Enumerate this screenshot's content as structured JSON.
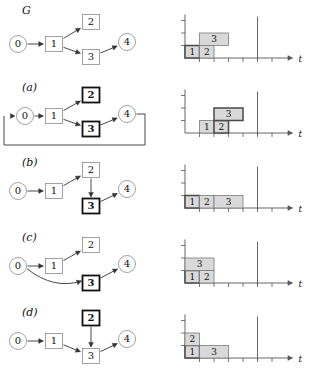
{
  "figure": {
    "title": "",
    "row_labels": [
      "G",
      "(a)",
      "(b)",
      "(c)",
      "(d)"
    ],
    "axis_label": "t",
    "node_ids": [
      "0",
      "1",
      "2",
      "3",
      "4"
    ],
    "colors": {
      "bar_fill": "#d9d9d9",
      "bar_stroke": "#7a7a7a",
      "bar_stroke_bold": "#4a4a4a",
      "node_stroke": "#8a8a8a",
      "node_stroke_bold": "#111111",
      "edge": "#333333",
      "axis": "#555555",
      "text": "#111111"
    }
  },
  "rows": [
    {
      "id": "G",
      "label": "G",
      "graph": {
        "nodes": [
          {
            "id": "0",
            "label": "0",
            "shape": "circle",
            "bold": false,
            "x": 18,
            "y": 44
          },
          {
            "id": "1",
            "label": "1",
            "shape": "box",
            "bold": false,
            "x": 54,
            "y": 44
          },
          {
            "id": "2",
            "label": "2",
            "shape": "box",
            "bold": false,
            "x": 91,
            "y": 22
          },
          {
            "id": "3",
            "label": "3",
            "shape": "box",
            "bold": false,
            "x": 91,
            "y": 57
          },
          {
            "id": "4",
            "label": "4",
            "shape": "circle",
            "bold": false,
            "x": 127,
            "y": 42
          }
        ],
        "edges": [
          {
            "from": "0",
            "to": "1",
            "style": "straight"
          },
          {
            "from": "1",
            "to": "2",
            "style": "straight"
          },
          {
            "from": "1",
            "to": "3",
            "style": "straight"
          },
          {
            "from": "3",
            "to": "4",
            "style": "straight"
          }
        ]
      },
      "chart_data": {
        "type": "bar",
        "orientation": "gantt",
        "title": "",
        "xlabel": "t",
        "ylabel": "",
        "xlim": [
          0,
          7
        ],
        "ylim": [
          0,
          3
        ],
        "grid": false,
        "xticks": [
          0,
          1,
          2,
          3,
          4,
          5,
          6
        ],
        "ticklabels": [],
        "deadline": 5,
        "tasks": [
          {
            "label": "1",
            "start": 0,
            "duration": 1,
            "lane": 0,
            "bold": true
          },
          {
            "label": "2",
            "start": 1,
            "duration": 1,
            "lane": 0,
            "bold": false
          },
          {
            "label": "3",
            "start": 1,
            "duration": 2,
            "lane": 1,
            "bold": false
          }
        ]
      }
    },
    {
      "id": "a",
      "label": "(a)",
      "graph": {
        "nodes": [
          {
            "id": "0",
            "label": "0",
            "shape": "circle",
            "bold": false,
            "x": 25,
            "y": 41
          },
          {
            "id": "1",
            "label": "1",
            "shape": "box",
            "bold": false,
            "x": 54,
            "y": 41
          },
          {
            "id": "2",
            "label": "2",
            "shape": "box",
            "bold": true,
            "x": 91,
            "y": 20
          },
          {
            "id": "3",
            "label": "3",
            "shape": "box",
            "bold": true,
            "x": 91,
            "y": 54
          },
          {
            "id": "4",
            "label": "4",
            "shape": "circle",
            "bold": false,
            "x": 127,
            "y": 39
          }
        ],
        "edges": [
          {
            "from": "0",
            "to": "1",
            "style": "straight"
          },
          {
            "from": "1",
            "to": "2",
            "style": "straight"
          },
          {
            "from": "1",
            "to": "3",
            "style": "straight"
          },
          {
            "from": "3",
            "to": "4",
            "style": "straight"
          },
          {
            "from": "4",
            "to": "0",
            "style": "feedback"
          }
        ]
      },
      "chart_data": {
        "type": "bar",
        "orientation": "gantt",
        "title": "",
        "xlabel": "t",
        "ylabel": "",
        "xlim": [
          0,
          7
        ],
        "ylim": [
          0,
          3
        ],
        "grid": false,
        "xticks": [
          0,
          1,
          2,
          3,
          4,
          5,
          6
        ],
        "ticklabels": [],
        "deadline": 5,
        "tasks": [
          {
            "label": "1",
            "start": 1,
            "duration": 1,
            "lane": 0,
            "bold": false
          },
          {
            "label": "2",
            "start": 2,
            "duration": 1,
            "lane": 0,
            "bold": true
          },
          {
            "label": "3",
            "start": 2,
            "duration": 2,
            "lane": 1,
            "bold": true
          }
        ]
      }
    },
    {
      "id": "b",
      "label": "(b)",
      "graph": {
        "nodes": [
          {
            "id": "0",
            "label": "0",
            "shape": "circle",
            "bold": false,
            "x": 18,
            "y": 41
          },
          {
            "id": "1",
            "label": "1",
            "shape": "box",
            "bold": false,
            "x": 54,
            "y": 41
          },
          {
            "id": "2",
            "label": "2",
            "shape": "box",
            "bold": false,
            "x": 91,
            "y": 20
          },
          {
            "id": "3",
            "label": "3",
            "shape": "box",
            "bold": true,
            "x": 91,
            "y": 56
          },
          {
            "id": "4",
            "label": "4",
            "shape": "circle",
            "bold": false,
            "x": 127,
            "y": 39
          }
        ],
        "edges": [
          {
            "from": "0",
            "to": "1",
            "style": "straight"
          },
          {
            "from": "1",
            "to": "2",
            "style": "straight"
          },
          {
            "from": "2",
            "to": "3",
            "style": "vertical"
          },
          {
            "from": "3",
            "to": "4",
            "style": "straight"
          }
        ]
      },
      "chart_data": {
        "type": "bar",
        "orientation": "gantt",
        "title": "",
        "xlabel": "t",
        "ylabel": "",
        "xlim": [
          0,
          7
        ],
        "ylim": [
          0,
          3
        ],
        "grid": false,
        "xticks": [
          0,
          1,
          2,
          3,
          4,
          5,
          6
        ],
        "ticklabels": [],
        "deadline": 5,
        "tasks": [
          {
            "label": "1",
            "start": 0,
            "duration": 1,
            "lane": 0,
            "bold": true
          },
          {
            "label": "2",
            "start": 1,
            "duration": 1,
            "lane": 0,
            "bold": false
          },
          {
            "label": "3",
            "start": 2,
            "duration": 2,
            "lane": 0,
            "bold": false
          }
        ]
      }
    },
    {
      "id": "c",
      "label": "(c)",
      "graph": {
        "nodes": [
          {
            "id": "0",
            "label": "0",
            "shape": "circle",
            "bold": false,
            "x": 18,
            "y": 41
          },
          {
            "id": "1",
            "label": "1",
            "shape": "box",
            "bold": false,
            "x": 54,
            "y": 41
          },
          {
            "id": "2",
            "label": "2",
            "shape": "box",
            "bold": false,
            "x": 91,
            "y": 20
          },
          {
            "id": "3",
            "label": "3",
            "shape": "box",
            "bold": true,
            "x": 91,
            "y": 58
          },
          {
            "id": "4",
            "label": "4",
            "shape": "circle",
            "bold": false,
            "x": 127,
            "y": 39
          }
        ],
        "edges": [
          {
            "from": "0",
            "to": "1",
            "style": "straight"
          },
          {
            "from": "1",
            "to": "2",
            "style": "straight"
          },
          {
            "from": "0",
            "to": "3",
            "style": "curved"
          },
          {
            "from": "3",
            "to": "4",
            "style": "straight"
          }
        ]
      },
      "chart_data": {
        "type": "bar",
        "orientation": "gantt",
        "title": "",
        "xlabel": "t",
        "ylabel": "",
        "xlim": [
          0,
          7
        ],
        "ylim": [
          0,
          3
        ],
        "grid": false,
        "xticks": [
          0,
          1,
          2,
          3,
          4,
          5,
          6
        ],
        "ticklabels": [],
        "deadline": 5,
        "tasks": [
          {
            "label": "1",
            "start": 0,
            "duration": 1,
            "lane": 0,
            "bold": true
          },
          {
            "label": "2",
            "start": 1,
            "duration": 1,
            "lane": 0,
            "bold": false
          },
          {
            "label": "3",
            "start": 0,
            "duration": 2,
            "lane": 1,
            "bold": false
          }
        ]
      }
    },
    {
      "id": "d",
      "label": "(d)",
      "graph": {
        "nodes": [
          {
            "id": "0",
            "label": "0",
            "shape": "circle",
            "bold": false,
            "x": 18,
            "y": 41
          },
          {
            "id": "1",
            "label": "1",
            "shape": "box",
            "bold": false,
            "x": 54,
            "y": 41
          },
          {
            "id": "2",
            "label": "2",
            "shape": "box",
            "bold": true,
            "x": 91,
            "y": 18
          },
          {
            "id": "3",
            "label": "3",
            "shape": "box",
            "bold": false,
            "x": 91,
            "y": 56
          },
          {
            "id": "4",
            "label": "4",
            "shape": "circle",
            "bold": false,
            "x": 127,
            "y": 39
          }
        ],
        "edges": [
          {
            "from": "0",
            "to": "1",
            "style": "straight"
          },
          {
            "from": "1",
            "to": "3",
            "style": "straight"
          },
          {
            "from": "2",
            "to": "3",
            "style": "vertical"
          },
          {
            "from": "3",
            "to": "4",
            "style": "straight"
          }
        ]
      },
      "chart_data": {
        "type": "bar",
        "orientation": "gantt",
        "title": "",
        "xlabel": "t",
        "ylabel": "",
        "xlim": [
          0,
          7
        ],
        "ylim": [
          0,
          3
        ],
        "grid": false,
        "xticks": [
          0,
          1,
          2,
          3,
          4,
          5,
          6
        ],
        "ticklabels": [],
        "deadline": 5,
        "tasks": [
          {
            "label": "1",
            "start": 0,
            "duration": 1,
            "lane": 0,
            "bold": true
          },
          {
            "label": "2",
            "start": 0,
            "duration": 1,
            "lane": 1,
            "bold": false
          },
          {
            "label": "3",
            "start": 1,
            "duration": 2,
            "lane": 0,
            "bold": false
          }
        ]
      }
    }
  ]
}
